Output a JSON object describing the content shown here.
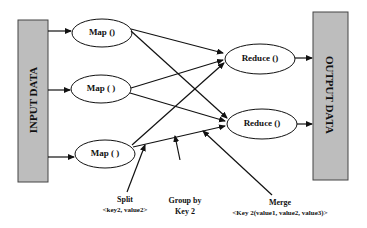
{
  "input_block": {
    "label": "INPUT DATA",
    "fill": "#bdbdbd"
  },
  "output_block": {
    "label": "OUTPUT DATA",
    "fill": "#bdbdbd"
  },
  "map_nodes": [
    {
      "label": "Map ()"
    },
    {
      "label": "Map ( )"
    },
    {
      "label": "Map ( )"
    }
  ],
  "reduce_nodes": [
    {
      "label": "Reduce ()"
    },
    {
      "label": "Reduce ()"
    }
  ],
  "annotations": {
    "split": {
      "title": "Split",
      "sub": "<key2, value2>"
    },
    "group": {
      "line1": "Group by",
      "line2": "Key 2"
    },
    "merge": {
      "title": "Merge",
      "sub": "<Key 2(value1, value2, value3)>"
    }
  }
}
